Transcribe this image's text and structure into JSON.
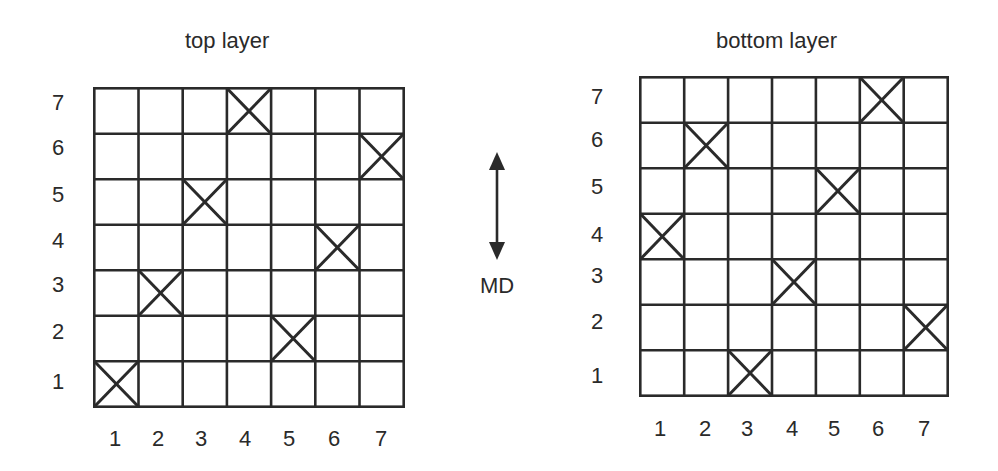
{
  "diagram": {
    "ink_color": "#2a2a2a",
    "grid_size": 7,
    "panels": [
      {
        "id": "top",
        "title": "top layer",
        "x_labels": [
          "1",
          "2",
          "3",
          "4",
          "5",
          "6",
          "7"
        ],
        "y_labels": [
          "7",
          "6",
          "5",
          "4",
          "3",
          "2",
          "1"
        ],
        "marked_cells": [
          {
            "col": 1,
            "row": 1
          },
          {
            "col": 2,
            "row": 3
          },
          {
            "col": 3,
            "row": 5
          },
          {
            "col": 4,
            "row": 7
          },
          {
            "col": 5,
            "row": 2
          },
          {
            "col": 6,
            "row": 4
          },
          {
            "col": 7,
            "row": 6
          }
        ]
      },
      {
        "id": "bottom",
        "title": "bottom layer",
        "x_labels": [
          "1",
          "2",
          "3",
          "4",
          "5",
          "6",
          "7"
        ],
        "y_labels": [
          "7",
          "6",
          "5",
          "4",
          "3",
          "2",
          "1"
        ],
        "marked_cells": [
          {
            "col": 1,
            "row": 4
          },
          {
            "col": 2,
            "row": 6
          },
          {
            "col": 3,
            "row": 1
          },
          {
            "col": 4,
            "row": 3
          },
          {
            "col": 5,
            "row": 5
          },
          {
            "col": 6,
            "row": 7
          },
          {
            "col": 7,
            "row": 2
          }
        ]
      }
    ],
    "direction_indicator": {
      "label": "MD",
      "icon": "double-headed-vertical-arrow"
    }
  }
}
